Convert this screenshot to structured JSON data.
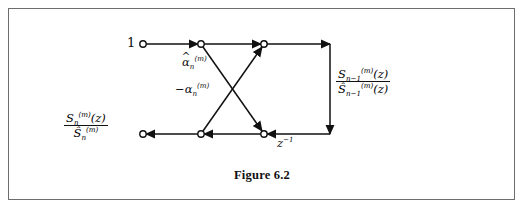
{
  "figure": {
    "caption": "Figure 6.2",
    "border_color": "#6d6d6d",
    "line_color": "#111111",
    "background": "#ffffff"
  },
  "labels": {
    "input_top": "1",
    "gain_upper": "α̂",
    "gain_upper_sub": "n",
    "gain_upper_sup": "(m)",
    "gain_lower_sign": "−",
    "gain_lower": "α",
    "gain_lower_sub": "n",
    "gain_lower_sup": "(m)",
    "delay": "z",
    "delay_sup": "−1",
    "left_num_S": "S",
    "left_num_sub": "n",
    "left_num_sup": "(m)",
    "left_num_arg": "(z)",
    "left_den_S": "Ŝ",
    "left_den_sub": "n",
    "left_den_sup": "(m)",
    "right_num_S": "S",
    "right_num_sub": "n−1",
    "right_num_sup": "(m)",
    "right_num_arg": "(z)",
    "right_den_S": "Ŝ",
    "right_den_sub": "n−1",
    "right_den_sup": "(m)",
    "right_den_arg": "(z)"
  },
  "graph": {
    "nodes": [
      {
        "name": "top-left-input-node",
        "x": 143,
        "y": 44
      },
      {
        "name": "top-mid-node",
        "x": 201,
        "y": 44
      },
      {
        "name": "top-right-node",
        "x": 264,
        "y": 44
      },
      {
        "name": "bottom-left-output-node",
        "x": 143,
        "y": 134
      },
      {
        "name": "bottom-mid-node",
        "x": 201,
        "y": 134
      },
      {
        "name": "bottom-right-node",
        "x": 264,
        "y": 134
      }
    ],
    "corner_top_right": {
      "x": 330,
      "y": 44
    },
    "corner_bottom_right": {
      "x": 330,
      "y": 134
    },
    "node_radius": 3.2
  }
}
